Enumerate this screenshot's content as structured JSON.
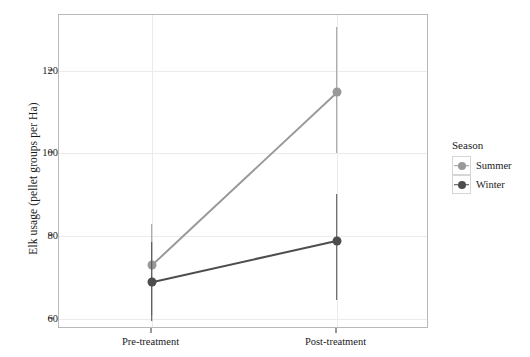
{
  "chart_data": {
    "type": "line",
    "title": "",
    "xlabel": "",
    "ylabel": "Elk usage (pellet groups per Ha)",
    "categories": [
      "Pre-treatment",
      "Post-treatment"
    ],
    "xtick_labels": [
      "Pre-treatment",
      "Post-treatment"
    ],
    "ytick_labels": [
      "60",
      "80",
      "100",
      "120"
    ],
    "ytick_values": [
      60,
      80,
      100,
      120
    ],
    "ylim": [
      57.5,
      133.5
    ],
    "grid": true,
    "grid_axis": "both",
    "legend": {
      "title": "Season",
      "position": "right",
      "entries": [
        {
          "label": "Summer",
          "color": "#999999"
        },
        {
          "label": "Winter",
          "color": "#4d4d4d"
        }
      ]
    },
    "series": [
      {
        "name": "Summer",
        "color": "#999999",
        "values": [
          73.0,
          114.8
        ],
        "error_low": [
          61.0,
          100.2
        ],
        "error_high": [
          83.0,
          130.6
        ]
      },
      {
        "name": "Winter",
        "color": "#4d4d4d",
        "values": [
          68.8,
          78.8
        ],
        "error_low": [
          59.4,
          64.5
        ],
        "error_high": [
          78.5,
          90.2
        ]
      }
    ]
  },
  "colors": {
    "panel_border": "#b9b9b9",
    "gridline": "#ebebeb",
    "background": "#ffffff",
    "text": "#1a1a1a"
  }
}
